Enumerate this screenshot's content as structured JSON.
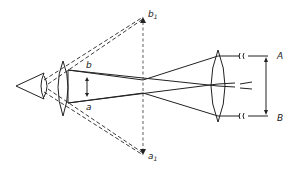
{
  "diagram": {
    "type": "optical-ray-diagram",
    "labels": {
      "b": "b",
      "a": "a",
      "b1_main": "b",
      "b1_sub": "1",
      "a1_main": "a",
      "a1_sub": "1",
      "A": "A",
      "B": "B"
    },
    "colors": {
      "line": "#222222",
      "background": "#ffffff"
    }
  }
}
